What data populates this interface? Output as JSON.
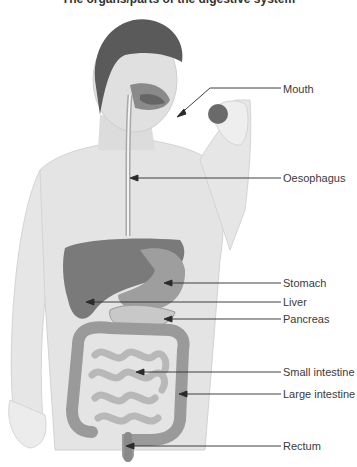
{
  "title": "The organs/parts of the digestive system",
  "labels": [
    {
      "id": "mouth",
      "text": "Mouth",
      "y": 89
    },
    {
      "id": "oesophagus",
      "text": "Oesophagus",
      "y": 178
    },
    {
      "id": "stomach",
      "text": "Stomach",
      "y": 283
    },
    {
      "id": "liver",
      "text": "Liver",
      "y": 302
    },
    {
      "id": "pancreas",
      "text": "Pancreas",
      "y": 319
    },
    {
      "id": "small-intestine",
      "text": "Small intestine",
      "y": 372
    },
    {
      "id": "large-intestine",
      "text": "Large intestine",
      "y": 394
    },
    {
      "id": "rectum",
      "text": "Rectum",
      "y": 446
    }
  ],
  "colors": {
    "skin": "#e2e2e2",
    "skin_shadow": "#cfcfcf",
    "hair": "#5a5a5a",
    "organ_dark": "#7a7a7a",
    "organ_mid": "#9a9a9a",
    "intestine": "#b4b4b4",
    "leader": "#2a2a2a"
  }
}
